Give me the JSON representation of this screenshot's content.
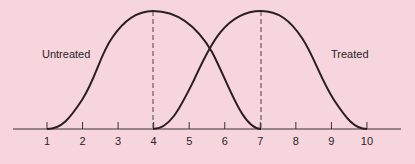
{
  "chart_data": {
    "type": "line",
    "title": "",
    "xlabel": "",
    "ylabel": "",
    "x_ticks": [
      "1",
      "2",
      "3",
      "4",
      "5",
      "6",
      "7",
      "8",
      "9",
      "10"
    ],
    "xlim": [
      0,
      11
    ],
    "grid": false,
    "series": [
      {
        "name": "Untreated",
        "shape": "bell-like curve",
        "start": 1,
        "peak": 4,
        "end": 7
      },
      {
        "name": "Treated",
        "shape": "bell-like curve",
        "start": 4,
        "peak": 7,
        "end": 10
      }
    ],
    "annotations": [
      {
        "type": "dashed-vertical-line",
        "x": 4
      },
      {
        "type": "dashed-vertical-line",
        "x": 7
      }
    ],
    "labels": {
      "untreated": "Untreated",
      "treated": "Treated"
    }
  },
  "colors": {
    "background": "#f6d6dc",
    "curve": "#2a1e22",
    "axis": "#3a3034"
  }
}
